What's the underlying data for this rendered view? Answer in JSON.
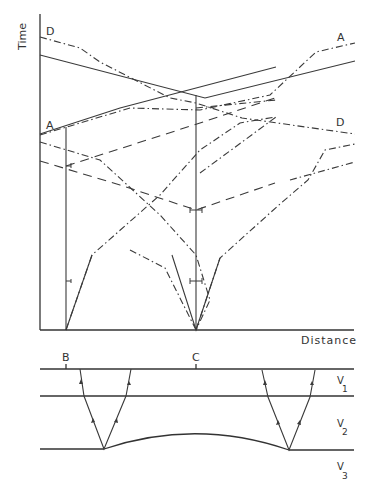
{
  "time_distance_plot": {
    "y_axis_label": "Time",
    "x_axis_label": "Distance",
    "curve_labels": {
      "D_left": "D",
      "A_right": "A",
      "A_left": "A",
      "D_right": "D"
    }
  },
  "cross_section": {
    "station_labels": {
      "B": "B",
      "C": "C"
    },
    "layers": [
      {
        "name": "V",
        "sub": "1"
      },
      {
        "name": "V",
        "sub": "2"
      },
      {
        "name": "V",
        "sub": "3"
      }
    ]
  },
  "colors": {
    "line": "#3a3a3a",
    "text": "#333333",
    "background": "#ffffff"
  }
}
